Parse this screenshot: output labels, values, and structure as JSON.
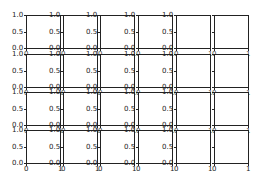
{
  "chart_data": {
    "type": "line",
    "title": "",
    "layout": {
      "rows": 4,
      "cols": 6
    },
    "subplots_note": "4x6 grid of empty axes with shared-looking tick layout",
    "xlim": [
      0,
      1
    ],
    "ylim": [
      0,
      1
    ],
    "xticks": [
      "0",
      "1"
    ],
    "yticks": [
      "0.0",
      "0.5",
      "1.0"
    ],
    "series": [],
    "grid": false,
    "legend": null,
    "yticklabels_visible_columns": [
      1,
      2,
      3,
      4,
      5
    ],
    "xticklabels_visible_row": 4
  },
  "geometry": {
    "col_left": [
      26,
      63,
      100,
      138,
      176,
      214
    ],
    "col_width": 35,
    "row_top": [
      15,
      54,
      92,
      130
    ],
    "row_height": 34
  },
  "colors": {
    "axes": "#222222",
    "text": "#222222",
    "background": "#ffffff"
  }
}
